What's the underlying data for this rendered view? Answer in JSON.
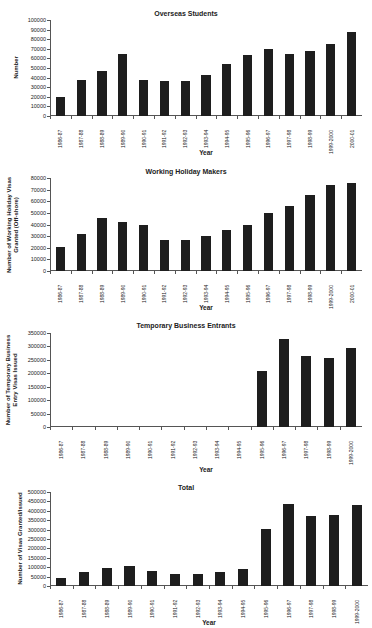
{
  "chart_data": [
    {
      "type": "bar",
      "title": "Overseas Students",
      "xlabel": "Year",
      "ylabel": "Number",
      "ylim": [
        0,
        100000
      ],
      "yticks": [
        0,
        10000,
        20000,
        30000,
        40000,
        50000,
        60000,
        70000,
        80000,
        90000,
        100000
      ],
      "categories": [
        "1986-87",
        "1987-88",
        "1988-89",
        "1989-90",
        "1990-91",
        "1991-92",
        "1992-93",
        "1993-94",
        "1994-95",
        "1995-96",
        "1996-97",
        "1997-98",
        "1998-99",
        "1999-2000",
        "2000-01"
      ],
      "values": [
        20000,
        38000,
        47000,
        65000,
        37000,
        36000,
        36500,
        42500,
        54000,
        64000,
        70000,
        64500,
        68000,
        75500,
        87000
      ],
      "grid": false,
      "legend": null
    },
    {
      "type": "bar",
      "title": "Working Holiday Makers",
      "xlabel": "Year",
      "ylabel": "Number of Working Holiday Visas Granted (Off-shore)",
      "ylim": [
        0,
        80000
      ],
      "yticks": [
        0,
        10000,
        20000,
        30000,
        40000,
        50000,
        60000,
        70000,
        80000
      ],
      "categories": [
        "1986-87",
        "1987-88",
        "1988-89",
        "1989-90",
        "1990-91",
        "1991-92",
        "1992-93",
        "1993-94",
        "1994-95",
        "1995-96",
        "1996-97",
        "1997-98",
        "1998-99",
        "1999-2000",
        "2000-01"
      ],
      "values": [
        21000,
        31500,
        46000,
        42000,
        40000,
        27000,
        26500,
        30000,
        35000,
        40000,
        50000,
        55500,
        65000,
        74000,
        75500
      ],
      "grid": false,
      "legend": null
    },
    {
      "type": "bar",
      "title": "Temporary Business Entrants",
      "xlabel": "Year",
      "ylabel": "Number of Temporary Business Entry Visas Issued",
      "ylim": [
        0,
        350000
      ],
      "yticks": [
        0,
        50000,
        100000,
        150000,
        200000,
        250000,
        300000,
        350000
      ],
      "categories": [
        "1986-87",
        "1987-88",
        "1988-89",
        "1989-90",
        "1990-91",
        "1991-92",
        "1992-93",
        "1993-94",
        "1994-95",
        "1995-96",
        "1996-97",
        "1997-98",
        "1998-99",
        "1999-2000"
      ],
      "values": [
        0,
        0,
        0,
        0,
        0,
        0,
        0,
        0,
        0,
        208000,
        328000,
        264000,
        257000,
        294000
      ],
      "grid": false,
      "legend": null
    },
    {
      "type": "bar",
      "title": "Total",
      "xlabel": "Year",
      "ylabel": "Number of Visas Granted/Issued",
      "ylim": [
        0,
        500000
      ],
      "yticks": [
        0,
        50000,
        100000,
        150000,
        200000,
        250000,
        300000,
        350000,
        400000,
        450000,
        500000
      ],
      "categories": [
        "1986-87",
        "1987-88",
        "1988-89",
        "1989-90",
        "1990-91",
        "1991-92",
        "1992-93",
        "1993-94",
        "1994-95",
        "1995-96",
        "1996-97",
        "1997-98",
        "1998-99",
        "1999-2000"
      ],
      "values": [
        43000,
        72000,
        95000,
        108000,
        80000,
        64000,
        64000,
        75000,
        90000,
        305000,
        435000,
        373000,
        378000,
        432000
      ],
      "grid": false,
      "legend": null
    }
  ],
  "layout": [
    {
      "top": 0,
      "titleY": 10,
      "plotLeft": 50,
      "plotTop": 20,
      "plotW": 312,
      "plotH": 96,
      "xlabelY": 149,
      "ylabelX": 16
    },
    {
      "top": 0,
      "titleY": 168,
      "plotLeft": 50,
      "plotTop": 178,
      "plotW": 312,
      "plotH": 93,
      "xlabelY": 304,
      "ylabelX": 12
    },
    {
      "top": 0,
      "titleY": 322,
      "plotLeft": 50,
      "plotTop": 333,
      "plotW": 312,
      "plotH": 94,
      "xlabelY": 466,
      "ylabelX": 12
    },
    {
      "top": 0,
      "titleY": 484,
      "plotLeft": 50,
      "plotTop": 492,
      "plotW": 318,
      "plotH": 94,
      "xlabelY": 619,
      "ylabelX": 20
    }
  ],
  "bar_color": "#1e1e1e",
  "axis_color": "#555555"
}
